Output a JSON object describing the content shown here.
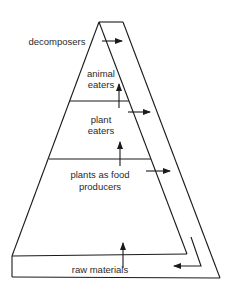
{
  "diagram": {
    "type": "food-pyramid",
    "levels": [
      {
        "id": "decomposers",
        "lines": [
          "decomposers"
        ]
      },
      {
        "id": "animal-eaters",
        "lines": [
          "animal",
          "eaters"
        ]
      },
      {
        "id": "plant-eaters",
        "lines": [
          "plant",
          "eaters"
        ]
      },
      {
        "id": "producers",
        "lines": [
          "plants as food",
          "producers"
        ]
      },
      {
        "id": "raw-materials",
        "lines": [
          "raw materials"
        ]
      }
    ],
    "colors": {
      "stroke": "#1a1a1a",
      "text": "#2a2a2a",
      "background": "#ffffff"
    }
  }
}
